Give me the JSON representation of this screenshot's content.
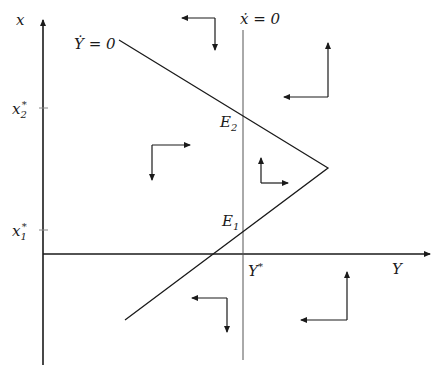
{
  "diagram": {
    "type": "phase-diagram",
    "axes": {
      "vertical_label": "x",
      "horizontal_label": "Y"
    },
    "ticks": {
      "x2_star": {
        "base": "x",
        "sub": "2",
        "sup": "*"
      },
      "x1_star": {
        "base": "x",
        "sub": "1",
        "sup": "*"
      },
      "Y_star": {
        "base": "Y",
        "sup": "*"
      }
    },
    "curves": {
      "xdot_zero": "ẋ = 0",
      "Ydot_zero": "Ẏ = 0"
    },
    "equilibria": {
      "E2": {
        "base": "E",
        "sub": "2"
      },
      "E1": {
        "base": "E",
        "sub": "1"
      }
    },
    "colors": {
      "line": "#1a1a1a",
      "nullcline_vertical": "#555555"
    }
  }
}
